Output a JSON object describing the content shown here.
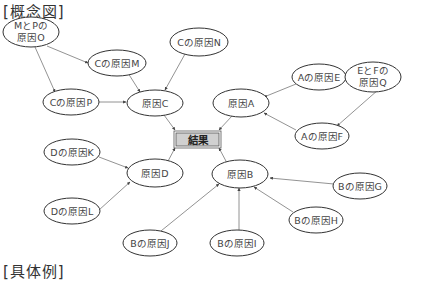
{
  "headings": {
    "concept": "[概念図]",
    "example": "[具体例]"
  },
  "result": {
    "label": "結果",
    "fill": "#d0d0d0",
    "stroke": "#555555"
  },
  "colors": {
    "line": "#777777",
    "ellipse_stroke": "#333333",
    "text": "#444444"
  },
  "nodes": {
    "o": {
      "lines": [
        "MとPの",
        "原因O"
      ]
    },
    "m": {
      "lines": [
        "Cの原因M"
      ]
    },
    "n": {
      "lines": [
        "Cの原因N"
      ]
    },
    "p": {
      "lines": [
        "Cの原因P"
      ]
    },
    "c": {
      "lines": [
        "原因C"
      ]
    },
    "a": {
      "lines": [
        "原因A"
      ]
    },
    "e": {
      "lines": [
        "Aの原因E"
      ]
    },
    "q": {
      "lines": [
        "EとFの",
        "原因Q"
      ]
    },
    "f": {
      "lines": [
        "Aの原因F"
      ]
    },
    "k": {
      "lines": [
        "Dの原因K"
      ]
    },
    "d": {
      "lines": [
        "原因D"
      ]
    },
    "l": {
      "lines": [
        "Dの原因L"
      ]
    },
    "b": {
      "lines": [
        "原因B"
      ]
    },
    "g": {
      "lines": [
        "Bの原因G"
      ]
    },
    "h": {
      "lines": [
        "Bの原因H"
      ]
    },
    "j": {
      "lines": [
        "Bの原因J"
      ]
    },
    "i": {
      "lines": [
        "Bの原因I"
      ]
    }
  },
  "edges": [
    [
      "o",
      "m"
    ],
    [
      "o",
      "p"
    ],
    [
      "m",
      "c"
    ],
    [
      "n",
      "c"
    ],
    [
      "p",
      "c"
    ],
    [
      "q",
      "e"
    ],
    [
      "q",
      "f"
    ],
    [
      "e",
      "a"
    ],
    [
      "f",
      "a"
    ],
    [
      "k",
      "d"
    ],
    [
      "l",
      "d"
    ],
    [
      "g",
      "b"
    ],
    [
      "h",
      "b"
    ],
    [
      "i",
      "b"
    ],
    [
      "j",
      "b"
    ],
    [
      "c",
      "result"
    ],
    [
      "a",
      "result"
    ],
    [
      "d",
      "result"
    ],
    [
      "b",
      "result"
    ]
  ]
}
